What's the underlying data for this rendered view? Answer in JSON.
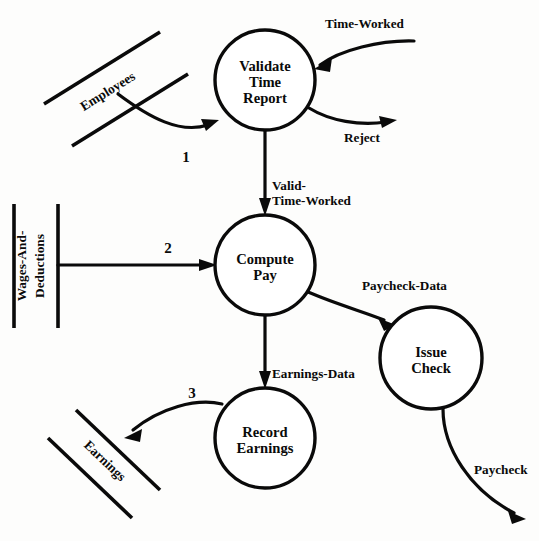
{
  "diagram": {
    "type": "data-flow-diagram",
    "processes": [
      {
        "id": "validate-time-report",
        "label_lines": [
          "Validate",
          "Time",
          "Report"
        ],
        "cx": 265,
        "cy": 80,
        "r": 50
      },
      {
        "id": "compute-pay",
        "label_lines": [
          "Compute",
          "Pay"
        ],
        "cx": 265,
        "cy": 265,
        "r": 50
      },
      {
        "id": "issue-check",
        "label_lines": [
          "Issue",
          "Check"
        ],
        "cx": 431,
        "cy": 358,
        "r": 51
      },
      {
        "id": "record-earnings",
        "label_lines": [
          "Record",
          "Earnings"
        ],
        "cx": 265,
        "cy": 438,
        "r": 50
      }
    ],
    "data_stores": [
      {
        "id": "employees",
        "label": "Employees",
        "orientation": "diagonal-up"
      },
      {
        "id": "wages-and-deductions",
        "label_lines": [
          "Wages-And-",
          "Deductions"
        ],
        "orientation": "vertical"
      },
      {
        "id": "earnings",
        "label": "Earnings",
        "orientation": "diagonal-down"
      }
    ],
    "flows": [
      {
        "id": "time-worked",
        "label": "Time-Worked",
        "from": "external",
        "to": "validate-time-report"
      },
      {
        "id": "reject",
        "label": "Reject",
        "from": "validate-time-report",
        "to": "external"
      },
      {
        "id": "employees-in",
        "label": "1",
        "from": "employees",
        "to": "validate-time-report"
      },
      {
        "id": "valid-time-worked",
        "label_lines": [
          "Valid-",
          "Time-Worked"
        ],
        "from": "validate-time-report",
        "to": "compute-pay"
      },
      {
        "id": "wages-in",
        "label": "2",
        "from": "wages-and-deductions",
        "to": "compute-pay"
      },
      {
        "id": "paycheck-data",
        "label": "Paycheck-Data",
        "from": "compute-pay",
        "to": "issue-check"
      },
      {
        "id": "earnings-data",
        "label": "Earnings-Data",
        "from": "compute-pay",
        "to": "record-earnings"
      },
      {
        "id": "earnings-out",
        "label": "3",
        "from": "record-earnings",
        "to": "earnings"
      },
      {
        "id": "paycheck",
        "label": "Paycheck",
        "from": "issue-check",
        "to": "external"
      }
    ],
    "labels": {
      "time_worked": "Time-Worked",
      "reject": "Reject",
      "valid_time_worked_line1": "Valid-",
      "valid_time_worked_line2": "Time-Worked",
      "paycheck_data": "Paycheck-Data",
      "earnings_data": "Earnings-Data",
      "paycheck": "Paycheck",
      "num_one": "1",
      "num_two": "2",
      "num_three": "3",
      "employees_store": "Employees",
      "wages_store_line1": "Wages-And-",
      "wages_store_line2": "Deductions",
      "earnings_store": "Earnings",
      "p1_line1": "Validate",
      "p1_line2": "Time",
      "p1_line3": "Report",
      "p2_line1": "Compute",
      "p2_line2": "Pay",
      "p3_line1": "Issue",
      "p3_line2": "Check",
      "p4_line1": "Record",
      "p4_line2": "Earnings"
    },
    "colors": {
      "stroke": "#0a0a0a",
      "fill": "#ffffff",
      "background": "#fdfdfc"
    }
  }
}
